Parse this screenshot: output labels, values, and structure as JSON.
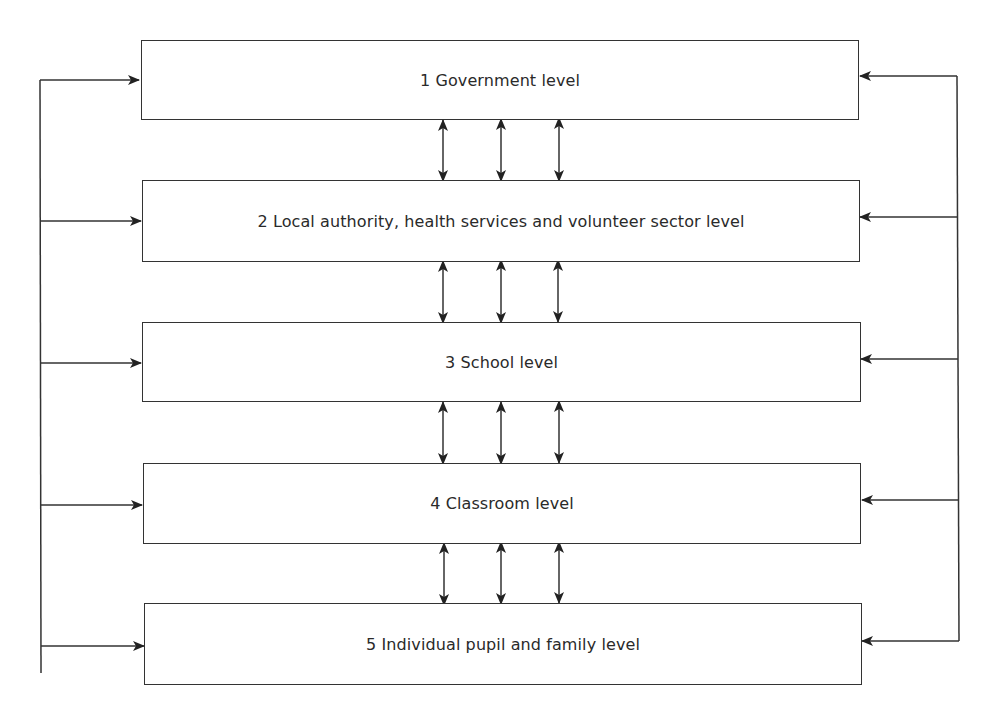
{
  "diagram": {
    "type": "hierarchical-levels-with-feedback",
    "colors": {
      "stroke": "#333333",
      "text": "#2a2a2a",
      "background": "#ffffff"
    },
    "levels": [
      {
        "number": "1",
        "label": "1 Government level"
      },
      {
        "number": "2",
        "label": "2 Local authority, health services and volunteer sector level"
      },
      {
        "number": "3",
        "label": "3 School level"
      },
      {
        "number": "4",
        "label": "4 Classroom level"
      },
      {
        "number": "5",
        "label": "5 Individual pupil and family level"
      }
    ],
    "connectors": {
      "between_adjacent_levels": "three bidirectional vertical arrows",
      "left_bus": "arrows from left vertical line into every level",
      "right_bus": "arrows from right vertical line into every level"
    }
  }
}
